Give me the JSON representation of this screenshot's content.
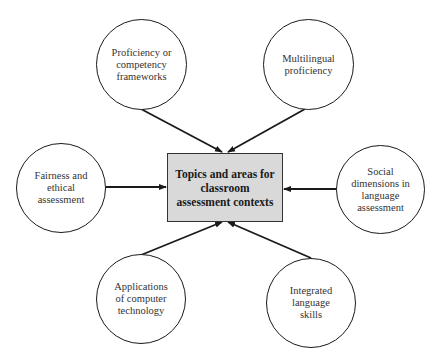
{
  "diagram": {
    "center": {
      "label": "Topics and areas for\nclassroom\nassessment contexts",
      "fill": "#d9d9d9"
    },
    "nodes": [
      {
        "id": "proficiency-frameworks",
        "label": "Proficiency or\ncompetency\nframeworks",
        "position": "top-left"
      },
      {
        "id": "multilingual-proficiency",
        "label": "Multilingual\nproficiency",
        "position": "top-right"
      },
      {
        "id": "fairness-ethical",
        "label": "Fairness and\nethical\nassessment",
        "position": "left"
      },
      {
        "id": "social-dimensions",
        "label": "Social\ndimensions in\nlanguage\nassessment",
        "position": "right"
      },
      {
        "id": "computer-technology",
        "label": "Applications\nof computer\ntechnology",
        "position": "bottom-left"
      },
      {
        "id": "integrated-skills",
        "label": "Integrated\nlanguage\nskills",
        "position": "bottom-right"
      }
    ],
    "edges": [
      {
        "from": "proficiency-frameworks",
        "to": "center",
        "arrow": true
      },
      {
        "from": "multilingual-proficiency",
        "to": "center",
        "arrow": true
      },
      {
        "from": "fairness-ethical",
        "to": "center",
        "arrow": true
      },
      {
        "from": "social-dimensions",
        "to": "center",
        "arrow": true
      },
      {
        "from": "computer-technology",
        "to": "center",
        "arrow": true
      },
      {
        "from": "integrated-skills",
        "to": "center",
        "arrow": true
      }
    ]
  }
}
